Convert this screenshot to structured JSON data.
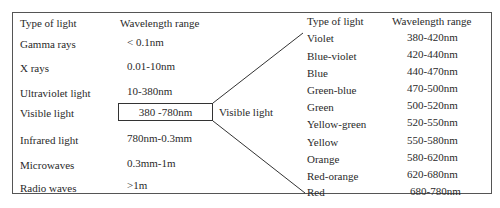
{
  "left_table": {
    "headers": {
      "type": "Type of light",
      "range": "Wavelength range"
    },
    "rows": [
      {
        "type": "Gamma rays",
        "range": "< 0.1nm"
      },
      {
        "type": "X rays",
        "range": "0.01-10nm"
      },
      {
        "type": "Ultraviolet light",
        "range": "10-380nm"
      },
      {
        "type": "Visible light",
        "range": "380 -780nm"
      },
      {
        "type": "Infrared light",
        "range": "780nm-0.3mm"
      },
      {
        "type": "Microwaves",
        "range": "0.3mm-1m"
      },
      {
        "type": "Radio waves",
        "range": ">1m"
      }
    ]
  },
  "connector_label": "Visible light",
  "right_table": {
    "headers": {
      "type": "Type of light",
      "range": "Wavelength range"
    },
    "rows": [
      {
        "type": "Violet",
        "range": "380-420nm"
      },
      {
        "type": "Blue-violet",
        "range": "420-440nm"
      },
      {
        "type": "Blue",
        "range": "440-470nm"
      },
      {
        "type": "Green-blue",
        "range": "470-500nm"
      },
      {
        "type": "Green",
        "range": "500-520nm"
      },
      {
        "type": "Yellow-green",
        "range": "520-550nm"
      },
      {
        "type": "Yellow",
        "range": "550-580nm"
      },
      {
        "type": "Orange",
        "range": "580-620nm"
      },
      {
        "type": "Red-orange",
        "range": "620-680nm"
      },
      {
        "type": "Red",
        "range": "680-780nm"
      }
    ]
  }
}
